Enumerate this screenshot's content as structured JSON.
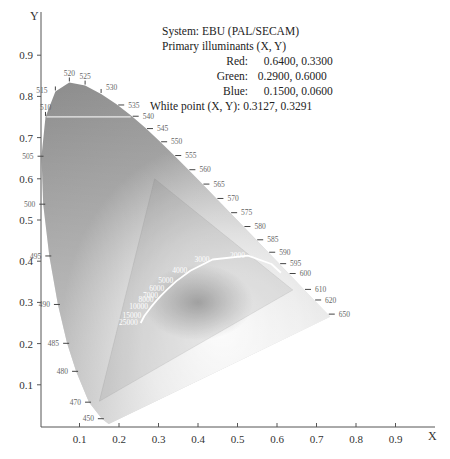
{
  "chart_data": {
    "type": "scatter",
    "xlabel": "X",
    "ylabel": "Y",
    "xlim": [
      0,
      1.0
    ],
    "ylim": [
      0,
      0.95
    ],
    "x_ticks": [
      "0.1",
      "0.2",
      "0.3",
      "0.4",
      "0.5",
      "0.6",
      "0.7",
      "0.8",
      "0.9"
    ],
    "y_ticks": [
      "0.1",
      "0.2",
      "0.3",
      "0.4",
      "0.5",
      "0.6",
      "0.7",
      "0.8",
      "0.9"
    ],
    "grid": false,
    "system": "EBU (PAL/SECAM)",
    "primaries": {
      "red": {
        "x": 0.64,
        "y": 0.33
      },
      "green": {
        "x": 0.29,
        "y": 0.6
      },
      "blue": {
        "x": 0.15,
        "y": 0.06
      }
    },
    "white_point": {
      "x": 0.3127,
      "y": 0.3291
    },
    "spectral_locus_labels": [
      {
        "nm": "450",
        "x": 0.1566,
        "y": 0.0177
      },
      {
        "nm": "470",
        "x": 0.1241,
        "y": 0.0578
      },
      {
        "nm": "480",
        "x": 0.0913,
        "y": 0.1327
      },
      {
        "nm": "485",
        "x": 0.0687,
        "y": 0.2007
      },
      {
        "nm": "490",
        "x": 0.0454,
        "y": 0.295
      },
      {
        "nm": "495",
        "x": 0.0235,
        "y": 0.4127
      },
      {
        "nm": "500",
        "x": 0.0082,
        "y": 0.5384
      },
      {
        "nm": "505",
        "x": 0.0039,
        "y": 0.6548
      },
      {
        "nm": "510",
        "x": 0.0139,
        "y": 0.7502
      },
      {
        "nm": "515",
        "x": 0.0389,
        "y": 0.812
      },
      {
        "nm": "520",
        "x": 0.0743,
        "y": 0.8338
      },
      {
        "nm": "525",
        "x": 0.1142,
        "y": 0.8262
      },
      {
        "nm": "530",
        "x": 0.1547,
        "y": 0.8059
      },
      {
        "nm": "535",
        "x": 0.1929,
        "y": 0.7816
      },
      {
        "nm": "540",
        "x": 0.2296,
        "y": 0.7543
      },
      {
        "nm": "545",
        "x": 0.2658,
        "y": 0.7243
      },
      {
        "nm": "550",
        "x": 0.3016,
        "y": 0.6923
      },
      {
        "nm": "555",
        "x": 0.3373,
        "y": 0.6589
      },
      {
        "nm": "560",
        "x": 0.3731,
        "y": 0.6245
      },
      {
        "nm": "565",
        "x": 0.4087,
        "y": 0.5896
      },
      {
        "nm": "570",
        "x": 0.4441,
        "y": 0.5547
      },
      {
        "nm": "575",
        "x": 0.4788,
        "y": 0.5202
      },
      {
        "nm": "580",
        "x": 0.5125,
        "y": 0.4866
      },
      {
        "nm": "585",
        "x": 0.5448,
        "y": 0.4544
      },
      {
        "nm": "590",
        "x": 0.5752,
        "y": 0.4242
      },
      {
        "nm": "595",
        "x": 0.6029,
        "y": 0.3965
      },
      {
        "nm": "600",
        "x": 0.627,
        "y": 0.3725
      },
      {
        "nm": "610",
        "x": 0.6658,
        "y": 0.334
      },
      {
        "nm": "620",
        "x": 0.6915,
        "y": 0.3083
      },
      {
        "nm": "650",
        "x": 0.726,
        "y": 0.274
      }
    ],
    "planckian_locus_labels": [
      "25000",
      "15000",
      "10000",
      "8000",
      "7000",
      "6000",
      "5000",
      "4000",
      "3000",
      "2000"
    ],
    "planckian_locus": [
      {
        "T": 25000,
        "x": 0.255,
        "y": 0.25
      },
      {
        "T": 15000,
        "x": 0.264,
        "y": 0.267
      },
      {
        "T": 10000,
        "x": 0.2807,
        "y": 0.2883
      },
      {
        "T": 8000,
        "x": 0.2952,
        "y": 0.3048
      },
      {
        "T": 7000,
        "x": 0.3064,
        "y": 0.3166
      },
      {
        "T": 6000,
        "x": 0.3222,
        "y": 0.3318
      },
      {
        "T": 5000,
        "x": 0.3451,
        "y": 0.3516
      },
      {
        "T": 4000,
        "x": 0.3805,
        "y": 0.3768
      },
      {
        "T": 3000,
        "x": 0.4369,
        "y": 0.4041
      },
      {
        "T": 2000,
        "x": 0.5267,
        "y": 0.4133
      },
      {
        "T": 1500,
        "x": 0.5857,
        "y": 0.3931
      }
    ]
  },
  "info": {
    "system_line": "System: EBU (PAL/SECAM)",
    "primaries_heading": "Primary illuminants (X, Y)",
    "red_label": "Red:",
    "red_value": "0.6400, 0.3300",
    "green_label": "Green:",
    "green_value": "0.2900, 0.6000",
    "blue_label": "Blue:",
    "blue_value": "0.1500, 0.0600",
    "white_line": "White point (X, Y): 0.3127, 0.3291"
  },
  "axes": {
    "x_label": "X",
    "y_label": "Y"
  },
  "colors": {
    "locus_fill_dark": "#8a8a8a",
    "locus_fill_light": "#f4f4f4",
    "axis": "#555555",
    "label_text": "#666666",
    "planckian_line": "#ffffff"
  }
}
